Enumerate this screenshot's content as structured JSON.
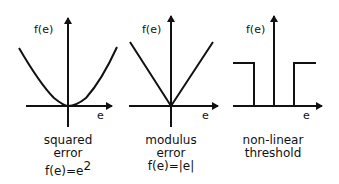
{
  "panels": [
    {
      "id": "squared",
      "y_label": "f(e)",
      "x_label": "e",
      "caption_line1": "squared",
      "caption_line2": "error",
      "formula_base": "f(e)=e",
      "formula_exp": "2",
      "shape": "parabola"
    },
    {
      "id": "modulus",
      "y_label": "f(e)",
      "x_label": "e",
      "caption_line1": "modulus",
      "caption_line2": "error",
      "formula": "f(e)=|e|",
      "shape": "v-shape"
    },
    {
      "id": "threshold",
      "y_label": "f(e)",
      "x_label": "e",
      "caption_line1": "non-linear",
      "caption_line2": "threshold",
      "shape": "step"
    }
  ],
  "colors": {
    "ink": "#111111",
    "background": "#ffffff"
  }
}
